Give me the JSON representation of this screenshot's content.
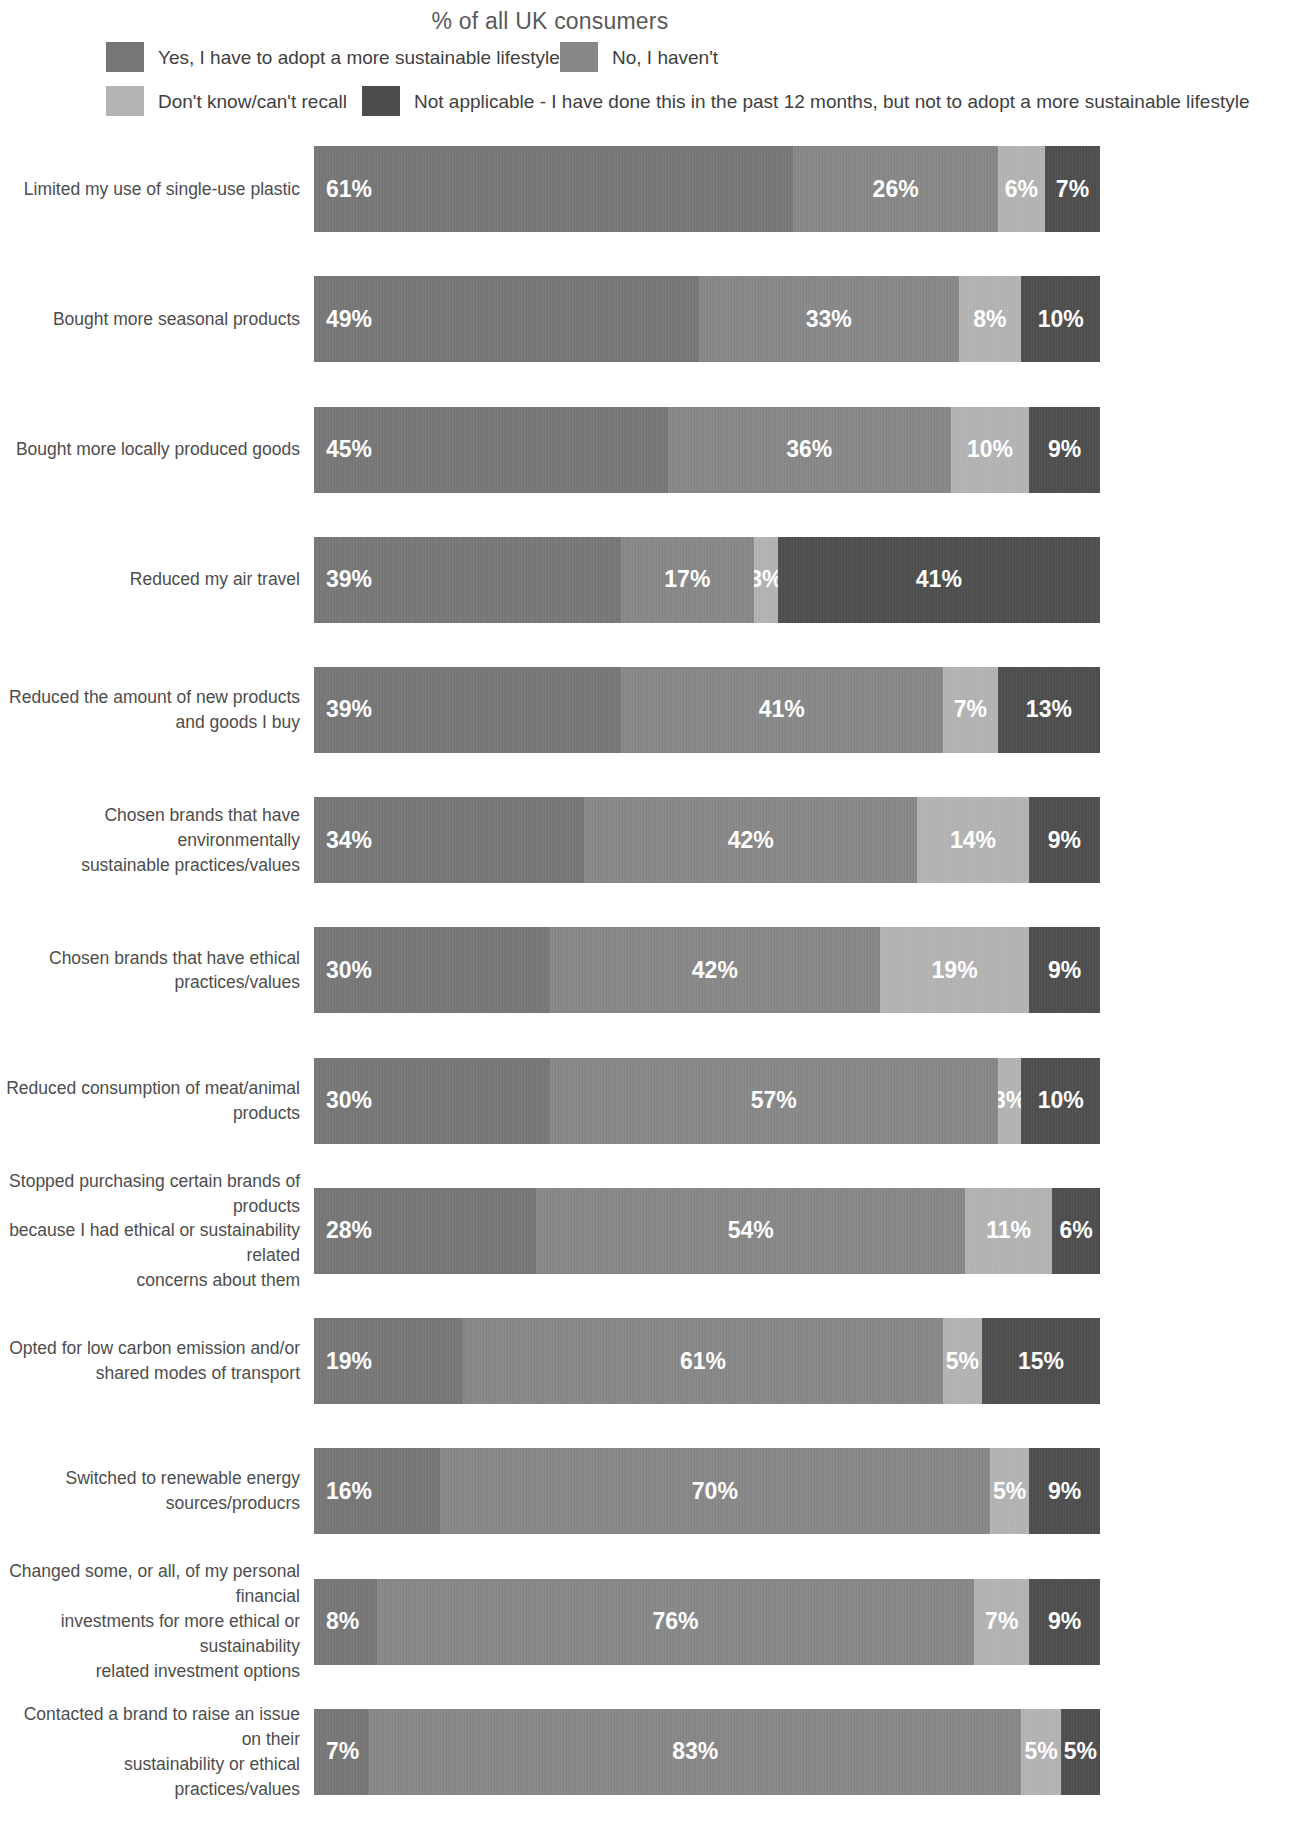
{
  "title": "% of all UK consumers",
  "colors": {
    "yes": "#767676",
    "no": "#878787",
    "dontknow": "#b3b3b3",
    "notapplicable": "#4d4d4d",
    "label_text": "#4d4d4d",
    "value_text": "#ffffff",
    "background": "#ffffff"
  },
  "legend": [
    {
      "key": "yes",
      "label": "Yes, I have to adopt a more sustainable lifestyle",
      "color": "#767676"
    },
    {
      "key": "no",
      "label": "No, I haven't",
      "color": "#878787"
    },
    {
      "key": "dontknow",
      "label": "Don't know/can't recall",
      "color": "#b3b3b3"
    },
    {
      "key": "notapplicable",
      "label": "Not applicable - I have done this in the past 12 months, but not to adopt a more sustainable lifestyle",
      "color": "#4d4d4d"
    }
  ],
  "chart_data": {
    "type": "bar",
    "subtype": "stacked-horizontal-100",
    "title": "% of all UK consumers",
    "xlabel": "",
    "ylabel": "",
    "xlim": [
      0,
      100
    ],
    "grid": false,
    "legend_position": "top",
    "series": [
      {
        "name": "Yes, I have to adopt a more sustainable lifestyle",
        "values": [
          61,
          49,
          45,
          39,
          39,
          34,
          30,
          30,
          28,
          19,
          16,
          8,
          7
        ]
      },
      {
        "name": "No, I haven't",
        "values": [
          26,
          33,
          36,
          17,
          41,
          42,
          42,
          57,
          54,
          61,
          70,
          76,
          83
        ]
      },
      {
        "name": "Don't know/can't recall",
        "values": [
          6,
          8,
          10,
          3,
          7,
          14,
          19,
          3,
          11,
          5,
          5,
          7,
          5
        ]
      },
      {
        "name": "Not applicable - I have done this in the past 12 months, but not to adopt a more sustainable lifestyle",
        "values": [
          7,
          10,
          9,
          41,
          13,
          9,
          9,
          10,
          6,
          15,
          9,
          9,
          5
        ]
      }
    ],
    "categories": [
      "Limited my use of single-use plastic",
      "Bought more seasonal products",
      "Bought more locally produced goods",
      "Reduced my air travel",
      "Reduced the amount of new products and goods I buy",
      "Chosen brands that have environmentally sustainable practices/values",
      "Chosen brands that have ethical practices/values",
      "Reduced consumption of meat/animal products",
      "Stopped purchasing certain brands of products because I had ethical or sustainability related concerns about them",
      "Opted for low carbon emission and/or shared modes of transport",
      "Switched to renewable energy sources/producrs",
      "Changed some, or all, of my personal financial investments for more ethical or sustainability related investment options",
      "Contacted a brand to raise an issue on their sustainability or ethical practices/values"
    ]
  },
  "rows": [
    {
      "label": "Limited my use of single-use plastic",
      "label_lines": [
        "Limited my use of single-use plastic"
      ],
      "height": 86,
      "segments": [
        {
          "key": "yes",
          "value": 61,
          "display": "61%",
          "color": "#767676"
        },
        {
          "key": "no",
          "value": 26,
          "display": "26%",
          "color": "#878787"
        },
        {
          "key": "dontknow",
          "value": 6,
          "display": "6%",
          "color": "#b3b3b3"
        },
        {
          "key": "notapplicable",
          "value": 7,
          "display": "7%",
          "color": "#4d4d4d"
        }
      ]
    },
    {
      "label": "Bought more seasonal products",
      "label_lines": [
        "Bought more seasonal products"
      ],
      "height": 86,
      "segments": [
        {
          "key": "yes",
          "value": 49,
          "display": "49%",
          "color": "#767676"
        },
        {
          "key": "no",
          "value": 33,
          "display": "33%",
          "color": "#878787"
        },
        {
          "key": "dontknow",
          "value": 8,
          "display": "8%",
          "color": "#b3b3b3"
        },
        {
          "key": "notapplicable",
          "value": 10,
          "display": "10%",
          "color": "#4d4d4d"
        }
      ]
    },
    {
      "label": "Bought more locally produced goods",
      "label_lines": [
        "Bought more locally produced goods"
      ],
      "height": 86,
      "segments": [
        {
          "key": "yes",
          "value": 45,
          "display": "45%",
          "color": "#767676"
        },
        {
          "key": "no",
          "value": 36,
          "display": "36%",
          "color": "#878787"
        },
        {
          "key": "dontknow",
          "value": 10,
          "display": "10%",
          "color": "#b3b3b3"
        },
        {
          "key": "notapplicable",
          "value": 9,
          "display": "9%",
          "color": "#4d4d4d"
        }
      ]
    },
    {
      "label": "Reduced my air travel",
      "label_lines": [
        "Reduced my air travel"
      ],
      "height": 86,
      "segments": [
        {
          "key": "yes",
          "value": 39,
          "display": "39%",
          "color": "#767676"
        },
        {
          "key": "no",
          "value": 17,
          "display": "17%",
          "color": "#878787"
        },
        {
          "key": "dontknow",
          "value": 3,
          "display": "3%",
          "color": "#b3b3b3"
        },
        {
          "key": "notapplicable",
          "value": 41,
          "display": "41%",
          "color": "#4d4d4d"
        }
      ]
    },
    {
      "label": "Reduced the amount of new products and goods I buy",
      "label_lines": [
        "Reduced the amount of new products",
        "and goods I buy"
      ],
      "height": 86,
      "segments": [
        {
          "key": "yes",
          "value": 39,
          "display": "39%",
          "color": "#767676"
        },
        {
          "key": "no",
          "value": 41,
          "display": "41%",
          "color": "#878787"
        },
        {
          "key": "dontknow",
          "value": 7,
          "display": "7%",
          "color": "#b3b3b3"
        },
        {
          "key": "notapplicable",
          "value": 13,
          "display": "13%",
          "color": "#4d4d4d"
        }
      ]
    },
    {
      "label": "Chosen brands that have environmentally sustainable practices/values",
      "label_lines": [
        "Chosen brands that have environmentally",
        "sustainable practices/values"
      ],
      "height": 86,
      "segments": [
        {
          "key": "yes",
          "value": 34,
          "display": "34%",
          "color": "#767676"
        },
        {
          "key": "no",
          "value": 42,
          "display": "42%",
          "color": "#878787"
        },
        {
          "key": "dontknow",
          "value": 14,
          "display": "14%",
          "color": "#b3b3b3"
        },
        {
          "key": "notapplicable",
          "value": 9,
          "display": "9%",
          "color": "#4d4d4d"
        }
      ]
    },
    {
      "label": "Chosen brands that have ethical practices/values",
      "label_lines": [
        "Chosen brands that have ethical practices/values"
      ],
      "height": 86,
      "segments": [
        {
          "key": "yes",
          "value": 30,
          "display": "30%",
          "color": "#767676"
        },
        {
          "key": "no",
          "value": 42,
          "display": "42%",
          "color": "#878787"
        },
        {
          "key": "dontknow",
          "value": 19,
          "display": "19%",
          "color": "#b3b3b3"
        },
        {
          "key": "notapplicable",
          "value": 9,
          "display": "9%",
          "color": "#4d4d4d"
        }
      ]
    },
    {
      "label": "Reduced consumption of meat/animal products",
      "label_lines": [
        "Reduced consumption of meat/animal products"
      ],
      "height": 86,
      "segments": [
        {
          "key": "yes",
          "value": 30,
          "display": "30%",
          "color": "#767676"
        },
        {
          "key": "no",
          "value": 57,
          "display": "57%",
          "color": "#878787"
        },
        {
          "key": "dontknow",
          "value": 3,
          "display": "3%",
          "color": "#b3b3b3"
        },
        {
          "key": "notapplicable",
          "value": 10,
          "display": "10%",
          "color": "#4d4d4d"
        }
      ]
    },
    {
      "label": "Stopped purchasing certain brands of products because I had ethical or sustainability related concerns about them",
      "label_lines": [
        "Stopped purchasing certain brands of products",
        "because I had ethical or sustainability related",
        "concerns about them"
      ],
      "height": 86,
      "segments": [
        {
          "key": "yes",
          "value": 28,
          "display": "28%",
          "color": "#767676"
        },
        {
          "key": "no",
          "value": 54,
          "display": "54%",
          "color": "#878787"
        },
        {
          "key": "dontknow",
          "value": 11,
          "display": "11%",
          "color": "#b3b3b3"
        },
        {
          "key": "notapplicable",
          "value": 6,
          "display": "6%",
          "color": "#4d4d4d"
        }
      ]
    },
    {
      "label": "Opted for low carbon emission and/or shared modes of transport",
      "label_lines": [
        "Opted for low carbon emission and/or",
        "shared modes of transport"
      ],
      "height": 86,
      "segments": [
        {
          "key": "yes",
          "value": 19,
          "display": "19%",
          "color": "#767676"
        },
        {
          "key": "no",
          "value": 61,
          "display": "61%",
          "color": "#878787"
        },
        {
          "key": "dontknow",
          "value": 5,
          "display": "5%",
          "color": "#b3b3b3"
        },
        {
          "key": "notapplicable",
          "value": 15,
          "display": "15%",
          "color": "#4d4d4d"
        }
      ]
    },
    {
      "label": "Switched to renewable energy sources/producrs",
      "label_lines": [
        "Switched to renewable energy sources/producrs"
      ],
      "height": 86,
      "segments": [
        {
          "key": "yes",
          "value": 16,
          "display": "16%",
          "color": "#767676"
        },
        {
          "key": "no",
          "value": 70,
          "display": "70%",
          "color": "#878787"
        },
        {
          "key": "dontknow",
          "value": 5,
          "display": "5%",
          "color": "#b3b3b3"
        },
        {
          "key": "notapplicable",
          "value": 9,
          "display": "9%",
          "color": "#4d4d4d"
        }
      ]
    },
    {
      "label": "Changed some, or all, of my personal financial investments for more ethical or sustainability related investment options",
      "label_lines": [
        "Changed some, or all, of my personal financial",
        "investments for more ethical or sustainability",
        "related investment options"
      ],
      "height": 86,
      "segments": [
        {
          "key": "yes",
          "value": 8,
          "display": "8%",
          "color": "#767676"
        },
        {
          "key": "no",
          "value": 76,
          "display": "76%",
          "color": "#878787"
        },
        {
          "key": "dontknow",
          "value": 7,
          "display": "7%",
          "color": "#b3b3b3"
        },
        {
          "key": "notapplicable",
          "value": 9,
          "display": "9%",
          "color": "#4d4d4d"
        }
      ]
    },
    {
      "label": "Contacted a brand to raise an issue on their sustainability or ethical practices/values",
      "label_lines": [
        "Contacted a brand to raise an issue on their",
        "sustainability or ethical practices/values"
      ],
      "height": 86,
      "segments": [
        {
          "key": "yes",
          "value": 7,
          "display": "7%",
          "color": "#767676"
        },
        {
          "key": "no",
          "value": 83,
          "display": "83%",
          "color": "#878787"
        },
        {
          "key": "dontknow",
          "value": 5,
          "display": "5%",
          "color": "#b3b3b3"
        },
        {
          "key": "notapplicable",
          "value": 5,
          "display": "5%",
          "color": "#4d4d4d"
        }
      ]
    }
  ]
}
